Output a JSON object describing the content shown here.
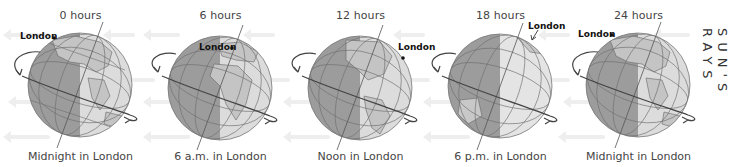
{
  "diagram": {
    "side_label": "SUN'S RAYS",
    "panels": [
      {
        "hours": "0 hours",
        "caption": "Midnight in London",
        "london_label": "London"
      },
      {
        "hours": "6 hours",
        "caption": "6 a.m. in London",
        "london_label": "London"
      },
      {
        "hours": "12 hours",
        "caption": "Noon in London",
        "london_label": "London"
      },
      {
        "hours": "18 hours",
        "caption": "6 p.m. in London",
        "london_label": "London"
      },
      {
        "hours": "24 hours",
        "caption": "Midnight in London",
        "london_label": "London"
      }
    ],
    "colors": {
      "night_side": "#9a9a9a",
      "day_side": "#d8d8d8",
      "grid": "#6f6f6f",
      "orbit_arrow": "#444444",
      "rays": "#eeeeee"
    }
  }
}
